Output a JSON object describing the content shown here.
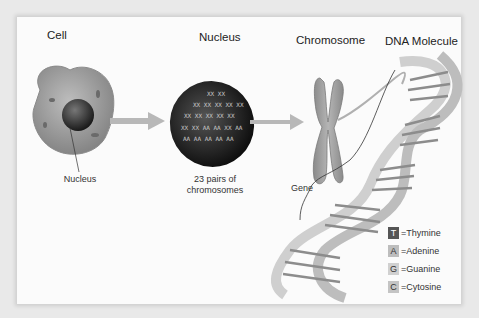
{
  "titles": {
    "cell": "Cell",
    "nucleus": "Nucleus",
    "chromosome": "Chromosome",
    "dna": "DNA Molecule"
  },
  "labels": {
    "cell_nucleus": "Nucleus",
    "pairs_line1": "23 pairs of",
    "pairs_line2": "chromosomes",
    "gene": "Gene"
  },
  "legend": [
    {
      "letter": "T",
      "text": "=Thymine",
      "color": "#555555",
      "fg": "#ffffff"
    },
    {
      "letter": "A",
      "text": "=Adenine",
      "color": "#bdbdbd",
      "fg": "#222222"
    },
    {
      "letter": "G",
      "text": "=Guanine",
      "color": "#d0d0d0",
      "fg": "#222222"
    },
    {
      "letter": "C",
      "text": "=Cytosine",
      "color": "#c4c4c4",
      "fg": "#222222"
    }
  ],
  "colors": {
    "background": "#e9e9e9",
    "card": "#fbfbfb",
    "arrow": "#b8b8b8",
    "cell": "#9a9a9a",
    "nucleus_dark": "#222222"
  }
}
